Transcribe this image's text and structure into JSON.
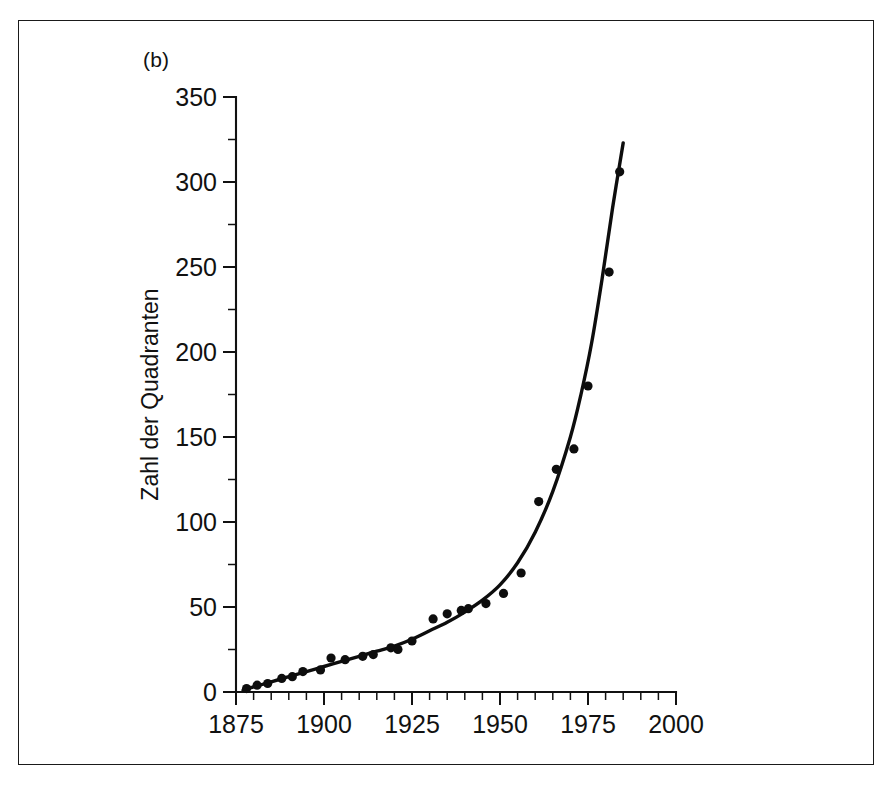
{
  "panel": {
    "label": "(b)"
  },
  "chart_data": {
    "type": "scatter",
    "title": "",
    "subtitle": "",
    "panel_label": "(b)",
    "xlabel": "",
    "ylabel": "Zahl der Quadranten",
    "xlim": [
      1875,
      2000
    ],
    "ylim": [
      0,
      350
    ],
    "grid": false,
    "legend": null,
    "x_ticks_major": [
      1875,
      1900,
      1925,
      1950,
      1975,
      2000
    ],
    "x_tick_labels": [
      "1875",
      "1900",
      "1925",
      "1950",
      "1975",
      "2000"
    ],
    "x_tick_minor_step": 5,
    "y_ticks_major": [
      0,
      50,
      100,
      150,
      200,
      250,
      300,
      350
    ],
    "y_tick_labels": [
      "0",
      "50",
      "100",
      "150",
      "200",
      "250",
      "300",
      "350"
    ],
    "y_tick_minor_step": 25,
    "marker": "filled-circle",
    "marker_color": "#0d0d0d",
    "line_color": "#0d0d0d",
    "series": [
      {
        "name": "Zahl der Quadranten (Datenpunkte)",
        "type": "scatter",
        "points": [
          {
            "x": 1878,
            "y": 2
          },
          {
            "x": 1881,
            "y": 4
          },
          {
            "x": 1884,
            "y": 5
          },
          {
            "x": 1888,
            "y": 8
          },
          {
            "x": 1891,
            "y": 9
          },
          {
            "x": 1894,
            "y": 12
          },
          {
            "x": 1899,
            "y": 13
          },
          {
            "x": 1902,
            "y": 20
          },
          {
            "x": 1906,
            "y": 19
          },
          {
            "x": 1911,
            "y": 21
          },
          {
            "x": 1914,
            "y": 22
          },
          {
            "x": 1919,
            "y": 26
          },
          {
            "x": 1921,
            "y": 25
          },
          {
            "x": 1925,
            "y": 30
          },
          {
            "x": 1931,
            "y": 43
          },
          {
            "x": 1935,
            "y": 46
          },
          {
            "x": 1939,
            "y": 48
          },
          {
            "x": 1941,
            "y": 49
          },
          {
            "x": 1946,
            "y": 52
          },
          {
            "x": 1951,
            "y": 58
          },
          {
            "x": 1956,
            "y": 70
          },
          {
            "x": 1961,
            "y": 112
          },
          {
            "x": 1966,
            "y": 131
          },
          {
            "x": 1971,
            "y": 143
          },
          {
            "x": 1975,
            "y": 180
          },
          {
            "x": 1981,
            "y": 247
          },
          {
            "x": 1984,
            "y": 306
          }
        ]
      },
      {
        "name": "Exponentielle Anpassungskurve",
        "type": "line",
        "points": [
          {
            "x": 1877,
            "y": 1
          },
          {
            "x": 1880,
            "y": 3
          },
          {
            "x": 1885,
            "y": 6
          },
          {
            "x": 1890,
            "y": 9
          },
          {
            "x": 1895,
            "y": 12
          },
          {
            "x": 1900,
            "y": 15
          },
          {
            "x": 1905,
            "y": 18
          },
          {
            "x": 1910,
            "y": 21
          },
          {
            "x": 1915,
            "y": 24
          },
          {
            "x": 1920,
            "y": 27
          },
          {
            "x": 1925,
            "y": 31
          },
          {
            "x": 1930,
            "y": 36
          },
          {
            "x": 1935,
            "y": 41
          },
          {
            "x": 1940,
            "y": 47
          },
          {
            "x": 1945,
            "y": 54
          },
          {
            "x": 1950,
            "y": 63
          },
          {
            "x": 1955,
            "y": 76
          },
          {
            "x": 1960,
            "y": 94
          },
          {
            "x": 1965,
            "y": 118
          },
          {
            "x": 1970,
            "y": 150
          },
          {
            "x": 1973,
            "y": 175
          },
          {
            "x": 1976,
            "y": 205
          },
          {
            "x": 1979,
            "y": 243
          },
          {
            "x": 1982,
            "y": 285
          },
          {
            "x": 1985,
            "y": 323
          }
        ]
      }
    ]
  }
}
